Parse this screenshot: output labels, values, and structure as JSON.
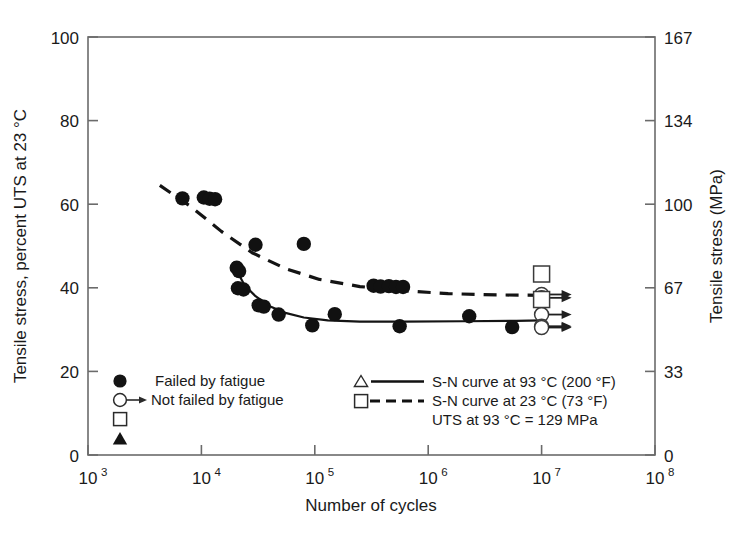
{
  "chart_data": {
    "type": "scatter",
    "title": "",
    "xlabel": "Number of cycles",
    "ylabel": "Tensile stress, percent UTS at 23 °C",
    "ylabel_right": "Tensile stress (MPa)",
    "xscale": "log",
    "xlim": [
      1000,
      100000000
    ],
    "ylim": [
      0,
      100
    ],
    "ylim_right": [
      0,
      167
    ],
    "grid": false,
    "xticks": [
      {
        "value": 1000,
        "label": "10",
        "exp": "3"
      },
      {
        "value": 10000,
        "label": "10",
        "exp": "4"
      },
      {
        "value": 100000,
        "label": "10",
        "exp": "5"
      },
      {
        "value": 1000000,
        "label": "10",
        "exp": "6"
      },
      {
        "value": 10000000,
        "label": "10",
        "exp": "7"
      },
      {
        "value": 100000000,
        "label": "10",
        "exp": "8"
      }
    ],
    "yticks_left": [
      {
        "value": 0,
        "label": "0"
      },
      {
        "value": 20,
        "label": "20"
      },
      {
        "value": 40,
        "label": "40"
      },
      {
        "value": 60,
        "label": "60"
      },
      {
        "value": 80,
        "label": "80"
      },
      {
        "value": 100,
        "label": "100"
      }
    ],
    "yticks_right": [
      {
        "value": 0,
        "label": "0"
      },
      {
        "value": 20,
        "label": "33"
      },
      {
        "value": 40,
        "label": "67"
      },
      {
        "value": 60,
        "label": "100"
      },
      {
        "value": 80,
        "label": "134"
      },
      {
        "value": 100,
        "label": "167"
      }
    ],
    "series": [
      {
        "name": "Failed by fatigue",
        "marker": "filled-circle",
        "points": [
          [
            6800,
            61.4
          ],
          [
            10500,
            61.6
          ],
          [
            11800,
            61.3
          ],
          [
            13200,
            61.2
          ],
          [
            20500,
            44.8
          ],
          [
            21500,
            44.0
          ],
          [
            21000,
            39.9
          ],
          [
            23500,
            39.6
          ],
          [
            30000,
            50.3
          ],
          [
            32000,
            35.8
          ],
          [
            35500,
            35.5
          ],
          [
            48000,
            33.6
          ],
          [
            80000,
            50.5
          ],
          [
            95000,
            31.0
          ],
          [
            150000,
            33.7
          ],
          [
            330000,
            40.5
          ],
          [
            380000,
            40.3
          ],
          [
            450000,
            40.4
          ],
          [
            520000,
            40.2
          ],
          [
            600000,
            40.2
          ],
          [
            560000,
            30.8
          ],
          [
            2300000,
            33.2
          ],
          [
            5500000,
            30.6
          ]
        ]
      },
      {
        "name": "Not failed by fatigue",
        "marker": "open-circle-arrow",
        "points": [
          [
            10000000,
            38.4
          ],
          [
            10000000,
            37.6
          ],
          [
            10000000,
            33.6
          ],
          [
            10000000,
            30.8
          ],
          [
            10000000,
            30.5
          ]
        ]
      },
      {
        "name": "Open square runout",
        "marker": "open-square",
        "points": [
          [
            10000000,
            43.3
          ],
          [
            10000000,
            37.2
          ]
        ]
      }
    ],
    "curves": [
      {
        "name": "S-N curve at 93 °C (200 °F)",
        "style": "solid",
        "points": [
          [
            19000,
            46.2
          ],
          [
            21000,
            43.6
          ],
          [
            24000,
            40.6
          ],
          [
            30000,
            38.0
          ],
          [
            40000,
            35.6
          ],
          [
            55000,
            34.0
          ],
          [
            80000,
            32.9
          ],
          [
            130000,
            32.2
          ],
          [
            250000,
            31.9
          ],
          [
            600000,
            31.9
          ],
          [
            2000000,
            32.0
          ],
          [
            6000000,
            32.1
          ],
          [
            10000000,
            32.2
          ]
        ]
      },
      {
        "name": "S-N curve at 23 °C (73 °F)",
        "style": "dashed",
        "points": [
          [
            4300,
            64.5
          ],
          [
            8000,
            59.5
          ],
          [
            15000,
            53.5
          ],
          [
            28000,
            48.4
          ],
          [
            55000,
            44.6
          ],
          [
            110000,
            42.0
          ],
          [
            250000,
            40.3
          ],
          [
            600000,
            39.3
          ],
          [
            1500000,
            38.6
          ],
          [
            4000000,
            38.3
          ],
          [
            10000000,
            38.2
          ]
        ]
      }
    ],
    "annotations": [
      "UTS at 93 °C = 129 MPa"
    ]
  },
  "legend": {
    "left_column": [
      {
        "symbol": "filled-circle",
        "label": "Failed by fatigue"
      },
      {
        "symbol": "open-circle-arrow",
        "label": "Not failed by fatigue"
      },
      {
        "symbol": "open-square",
        "label": ""
      },
      {
        "symbol": "filled-triangle",
        "label": ""
      }
    ],
    "right_column": [
      {
        "symbol": "open-triangle",
        "line": "solid",
        "label": "S-N curve at 93 °C (200 °F)"
      },
      {
        "symbol": "open-square",
        "line": "dashed",
        "label": "S-N curve at 23 °C (73 °F)"
      },
      {
        "symbol": "none",
        "line": "none",
        "label": "UTS at 93 °C = 129 MPa"
      }
    ]
  },
  "colors": {
    "ink": "#1a1a1a",
    "axis": "#555555",
    "background": "#ffffff"
  }
}
